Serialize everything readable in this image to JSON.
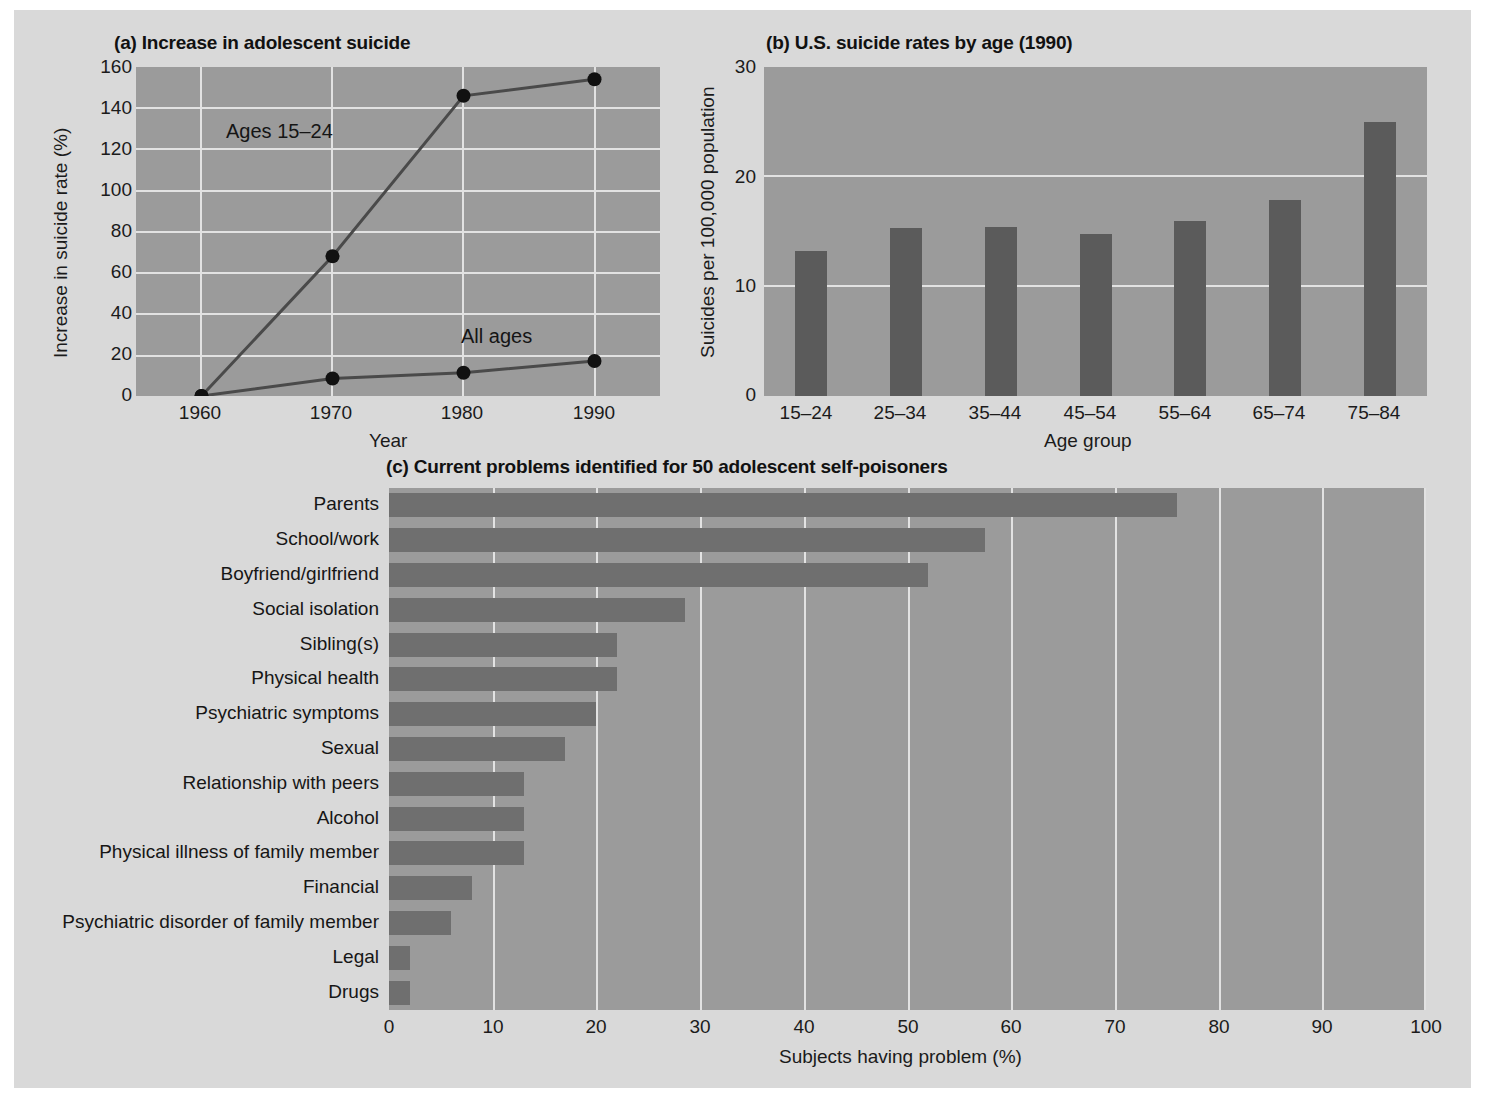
{
  "figure": {
    "background": "#d9d9d9",
    "plot_background": "#9b9b9b",
    "grid_color": "#e2e2e2",
    "bar_color_b": "#5b5b5b",
    "bar_color_c": "#6f6f6f",
    "line_color": "#4a4a4a",
    "marker_color": "#111111"
  },
  "chart_data": [
    {
      "type": "line",
      "panel": "a",
      "title": "(a) Increase in adolescent suicide",
      "title_prefix": "(a)",
      "title_text": "Increase in adolescent suicide",
      "xlabel": "Year",
      "ylabel": "Increase in suicide rate (%)",
      "x": [
        1960,
        1970,
        1980,
        1990
      ],
      "xticks": [
        "1960",
        "1970",
        "1980",
        "1990"
      ],
      "yticks": [
        "0",
        "20",
        "40",
        "60",
        "80",
        "100",
        "120",
        "140",
        "160"
      ],
      "xlim": [
        1955,
        1995
      ],
      "ylim": [
        0,
        160
      ],
      "grid": true,
      "legend_position": "inline-annotation",
      "series": [
        {
          "name": "Ages 15–24",
          "values": [
            0,
            68,
            146,
            154
          ],
          "annotation": "Ages 15–24"
        },
        {
          "name": "All ages",
          "values": [
            0,
            8.5,
            11.3,
            17
          ],
          "annotation": "All ages"
        }
      ]
    },
    {
      "type": "bar",
      "panel": "b",
      "title": "(b) U.S. suicide rates by age (1990)",
      "title_prefix": "(b)",
      "title_text": "U.S. suicide rates by age (1990)",
      "xlabel": "Age group",
      "ylabel": "Suicides per 100,000 population",
      "categories": [
        "15–24",
        "25–34",
        "35–44",
        "45–54",
        "55–64",
        "65–74",
        "75–84"
      ],
      "values": [
        13.2,
        15.3,
        15.4,
        14.8,
        16.0,
        17.9,
        25.0
      ],
      "yticks": [
        "0",
        "10",
        "20",
        "30"
      ],
      "ylim": [
        0,
        30
      ],
      "grid": true,
      "legend_position": "none"
    },
    {
      "type": "bar",
      "panel": "c",
      "orientation": "horizontal",
      "title": "(c) Current problems identified for 50 adolescent self-poisoners",
      "title_prefix": "(c)",
      "title_text": "Current problems identified for 50 adolescent self-poisoners",
      "xlabel": "Subjects having problem (%)",
      "ylabel": "",
      "categories": [
        "Parents",
        "School/work",
        "Boyfriend/girlfriend",
        "Social isolation",
        "Sibling(s)",
        "Physical health",
        "Psychiatric symptoms",
        "Sexual",
        "Relationship with peers",
        "Alcohol",
        "Physical illness of family member",
        "Financial",
        "Psychiatric disorder of  family member",
        "Legal",
        "Drugs"
      ],
      "values": [
        76,
        57.5,
        52,
        28.5,
        22,
        22,
        20,
        17,
        13,
        13,
        13,
        8,
        6,
        2,
        2
      ],
      "xticks": [
        "0",
        "10",
        "20",
        "30",
        "40",
        "50",
        "60",
        "70",
        "80",
        "90",
        "100"
      ],
      "xlim": [
        0,
        100
      ],
      "grid": true,
      "legend_position": "none"
    }
  ]
}
